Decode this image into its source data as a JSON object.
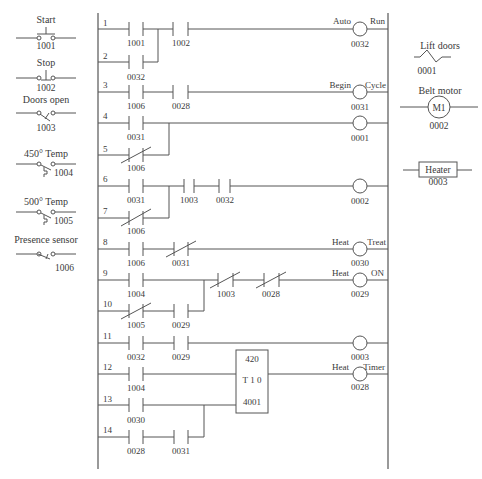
{
  "legend_inputs": [
    {
      "label": "Start",
      "address": "1001",
      "type": "pushbutton-no"
    },
    {
      "label": "Stop",
      "address": "1002",
      "type": "pushbutton-nc"
    },
    {
      "label": "Doors open",
      "address": "1003",
      "type": "limit-switch"
    },
    {
      "label": "450° Temp",
      "address": "1004",
      "type": "temperature-switch"
    },
    {
      "label": "500° Temp",
      "address": "1005",
      "type": "temperature-switch"
    },
    {
      "label": "Presence sensor",
      "address": "1006",
      "type": "proximity-switch"
    }
  ],
  "legend_outputs": [
    {
      "label": "Lift doors",
      "address": "0001",
      "type": "solenoid"
    },
    {
      "label": "Belt motor",
      "address": "0002",
      "type": "motor",
      "symbol": "M1"
    },
    {
      "label": "Heater",
      "address": "0003",
      "type": "heater"
    }
  ],
  "rungs": [
    {
      "number": "1",
      "contacts": [
        "1001",
        "1002"
      ],
      "coil": {
        "address": "0032",
        "left_label": "Auto",
        "right_label": "Run"
      }
    },
    {
      "number": "2",
      "contacts": [
        "0032"
      ]
    },
    {
      "number": "3",
      "contacts": [
        "1006",
        "0028"
      ],
      "coil": {
        "address": "0031",
        "left_label": "Begin",
        "right_label": "Cycle"
      }
    },
    {
      "number": "4",
      "contacts": [
        "0031"
      ],
      "coil": {
        "address": "0001"
      }
    },
    {
      "number": "5",
      "contacts": [
        "1006"
      ]
    },
    {
      "number": "6",
      "contacts": [
        "0031",
        "1003",
        "0032"
      ],
      "coil": {
        "address": "0002"
      }
    },
    {
      "number": "7",
      "contacts": [
        "1006"
      ]
    },
    {
      "number": "8",
      "contacts": [
        "1006",
        "0031"
      ],
      "coil": {
        "address": "0030",
        "left_label": "Heat",
        "right_label": "Treat"
      }
    },
    {
      "number": "9",
      "contacts": [
        "1004",
        "1003",
        "0028"
      ],
      "coil": {
        "address": "0029",
        "left_label": "Heat",
        "right_label": "ON"
      }
    },
    {
      "number": "10",
      "contacts": [
        "1005",
        "0029"
      ]
    },
    {
      "number": "11",
      "contacts": [
        "0032",
        "0029"
      ],
      "coil": {
        "address": "0003"
      }
    },
    {
      "number": "12",
      "contacts": [
        "1004"
      ],
      "coil": {
        "address": "0028",
        "left_label": "Heat",
        "right_label": "Timer"
      }
    },
    {
      "number": "13",
      "contacts": [
        "0030"
      ]
    },
    {
      "number": "14",
      "contacts": [
        "0028",
        "0031"
      ]
    }
  ],
  "timer": {
    "preset": "420",
    "name": "T 1 0",
    "address": "4001"
  }
}
